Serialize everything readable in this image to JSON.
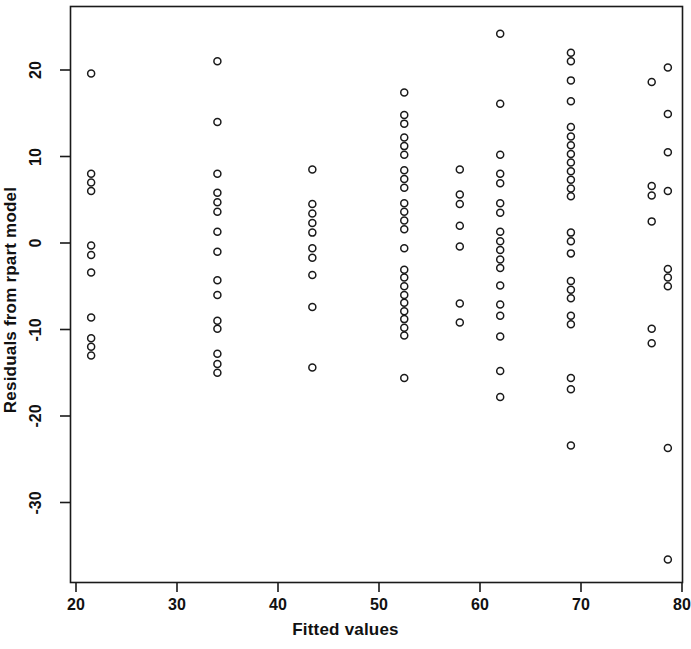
{
  "chart_data": {
    "type": "scatter",
    "title": "",
    "xlabel": "Fitted values",
    "ylabel": "Residuals from rpart model",
    "xlim": [
      20,
      80
    ],
    "ylim": [
      -38,
      26
    ],
    "xticks": [
      20,
      30,
      40,
      50,
      60,
      70,
      80
    ],
    "yticks": [
      -30,
      -20,
      -10,
      0,
      10,
      20
    ],
    "grid": false,
    "legend": null,
    "marker": {
      "shape": "circle-open",
      "edge_color": "#1a1a1a",
      "fill": "none",
      "size_px": 7
    },
    "frame": {
      "color": "#1a1a1a",
      "box": true
    },
    "points": [
      [
        21.5,
        19.6
      ],
      [
        21.5,
        8.0
      ],
      [
        21.5,
        7.0
      ],
      [
        21.5,
        6.0
      ],
      [
        21.5,
        -0.3
      ],
      [
        21.5,
        -1.4
      ],
      [
        21.5,
        -3.4
      ],
      [
        21.5,
        -8.6
      ],
      [
        21.5,
        -11.0
      ],
      [
        21.5,
        -12.0
      ],
      [
        21.5,
        -13.0
      ],
      [
        34.0,
        21.0
      ],
      [
        34.0,
        14.0
      ],
      [
        34.0,
        8.0
      ],
      [
        34.0,
        5.8
      ],
      [
        34.0,
        4.7
      ],
      [
        34.0,
        3.6
      ],
      [
        34.0,
        1.3
      ],
      [
        34.0,
        -1.0
      ],
      [
        34.0,
        -4.3
      ],
      [
        34.0,
        -6.0
      ],
      [
        34.0,
        -12.8
      ],
      [
        34.0,
        -14.0
      ],
      [
        34.0,
        -15.0
      ],
      [
        34.0,
        -9.0
      ],
      [
        34.0,
        -9.9
      ],
      [
        43.4,
        8.5
      ],
      [
        43.4,
        4.5
      ],
      [
        43.4,
        3.4
      ],
      [
        43.4,
        2.3
      ],
      [
        43.4,
        1.2
      ],
      [
        43.4,
        -0.6
      ],
      [
        43.4,
        -1.7
      ],
      [
        43.4,
        -3.7
      ],
      [
        43.4,
        -7.4
      ],
      [
        43.4,
        -14.4
      ],
      [
        52.5,
        17.4
      ],
      [
        52.5,
        14.8
      ],
      [
        52.5,
        13.8
      ],
      [
        52.5,
        12.2
      ],
      [
        52.5,
        11.2
      ],
      [
        52.5,
        10.2
      ],
      [
        52.5,
        8.4
      ],
      [
        52.5,
        7.4
      ],
      [
        52.5,
        6.4
      ],
      [
        52.5,
        4.6
      ],
      [
        52.5,
        3.6
      ],
      [
        52.5,
        2.6
      ],
      [
        52.5,
        1.6
      ],
      [
        52.5,
        -0.6
      ],
      [
        52.5,
        -3.1
      ],
      [
        52.5,
        -4.0
      ],
      [
        52.5,
        -5.0
      ],
      [
        52.5,
        -6.0
      ],
      [
        52.5,
        -6.9
      ],
      [
        52.5,
        -7.9
      ],
      [
        52.5,
        -8.8
      ],
      [
        52.5,
        -9.8
      ],
      [
        52.5,
        -10.7
      ],
      [
        52.5,
        -15.6
      ],
      [
        58.0,
        8.5
      ],
      [
        58.0,
        5.6
      ],
      [
        58.0,
        4.5
      ],
      [
        58.0,
        2.0
      ],
      [
        58.0,
        -0.4
      ],
      [
        58.0,
        -7.0
      ],
      [
        58.0,
        -9.2
      ],
      [
        62.0,
        24.2
      ],
      [
        62.0,
        16.1
      ],
      [
        62.0,
        10.2
      ],
      [
        62.0,
        8.0
      ],
      [
        62.0,
        6.9
      ],
      [
        62.0,
        4.6
      ],
      [
        62.0,
        3.5
      ],
      [
        62.0,
        1.3
      ],
      [
        62.0,
        0.2
      ],
      [
        62.0,
        -0.8
      ],
      [
        62.0,
        -1.9
      ],
      [
        62.0,
        -2.9
      ],
      [
        62.0,
        -4.9
      ],
      [
        62.0,
        -7.1
      ],
      [
        62.0,
        -8.4
      ],
      [
        62.0,
        -10.8
      ],
      [
        62.0,
        -14.8
      ],
      [
        62.0,
        -17.8
      ],
      [
        69.0,
        22.0
      ],
      [
        69.0,
        21.0
      ],
      [
        69.0,
        18.8
      ],
      [
        69.0,
        16.4
      ],
      [
        69.0,
        13.4
      ],
      [
        69.0,
        12.3
      ],
      [
        69.0,
        11.3
      ],
      [
        69.0,
        10.3
      ],
      [
        69.0,
        9.3
      ],
      [
        69.0,
        8.3
      ],
      [
        69.0,
        7.3
      ],
      [
        69.0,
        6.3
      ],
      [
        69.0,
        5.4
      ],
      [
        69.0,
        1.2
      ],
      [
        69.0,
        0.2
      ],
      [
        69.0,
        -1.2
      ],
      [
        69.0,
        -4.4
      ],
      [
        69.0,
        -5.4
      ],
      [
        69.0,
        -6.4
      ],
      [
        69.0,
        -8.4
      ],
      [
        69.0,
        -9.4
      ],
      [
        69.0,
        -15.6
      ],
      [
        69.0,
        -16.9
      ],
      [
        69.0,
        -23.4
      ],
      [
        77.0,
        18.6
      ],
      [
        77.0,
        6.6
      ],
      [
        77.0,
        5.5
      ],
      [
        77.0,
        2.5
      ],
      [
        77.0,
        -9.9
      ],
      [
        77.0,
        -11.6
      ],
      [
        78.6,
        20.3
      ],
      [
        78.6,
        14.9
      ],
      [
        78.6,
        10.5
      ],
      [
        78.6,
        6.0
      ],
      [
        78.6,
        -3.0
      ],
      [
        78.6,
        -4.0
      ],
      [
        78.6,
        -5.0
      ],
      [
        78.6,
        -23.7
      ],
      [
        78.6,
        -36.6
      ]
    ]
  }
}
